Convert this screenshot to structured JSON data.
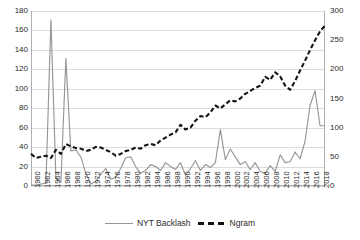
{
  "chart_data": {
    "type": "line",
    "title": "",
    "xlabel": "",
    "ylabel": "",
    "grid": true,
    "legend_position": "bottom",
    "x": [
      1960,
      1961,
      1962,
      1963,
      1964,
      1965,
      1966,
      1967,
      1968,
      1969,
      1970,
      1971,
      1972,
      1973,
      1974,
      1975,
      1976,
      1977,
      1978,
      1979,
      1980,
      1981,
      1982,
      1983,
      1984,
      1985,
      1986,
      1987,
      1988,
      1989,
      1990,
      1991,
      1992,
      1993,
      1994,
      1995,
      1996,
      1997,
      1998,
      1999,
      2000,
      2001,
      2002,
      2003,
      2004,
      2005,
      2006,
      2007,
      2008,
      2009,
      2010,
      2011,
      2012,
      2013,
      2014,
      2015,
      2016,
      2017,
      2018,
      2019
    ],
    "xtick_labels": [
      "1960",
      "1962",
      "1964",
      "1966",
      "1968",
      "1970",
      "1972",
      "1974",
      "1976",
      "1978",
      "1980",
      "1982",
      "1984",
      "1986",
      "1988",
      "1990",
      "1992",
      "1994",
      "1996",
      "1998",
      "2000",
      "2002",
      "2004",
      "2006",
      "2008",
      "2010",
      "2012",
      "2014",
      "2016",
      "2018"
    ],
    "xtick_values": [
      1960,
      1962,
      1964,
      1966,
      1968,
      1970,
      1972,
      1974,
      1976,
      1978,
      1980,
      1982,
      1984,
      1986,
      1988,
      1990,
      1992,
      1994,
      1996,
      1998,
      2000,
      2002,
      2004,
      2006,
      2008,
      2010,
      2012,
      2014,
      2016,
      2018
    ],
    "left_axis": {
      "label": "",
      "ylim": [
        0,
        180
      ],
      "ticks": [
        0,
        20,
        40,
        60,
        80,
        100,
        120,
        140,
        160,
        180
      ],
      "tick_labels": [
        "0",
        "20",
        "40",
        "60",
        "80",
        "100",
        "120",
        "140",
        "160",
        "180"
      ]
    },
    "right_axis": {
      "label": "",
      "ylim": [
        0,
        300
      ],
      "ticks": [
        0,
        50,
        100,
        150,
        200,
        250,
        300
      ],
      "tick_labels": [
        "0",
        "50",
        "100",
        "150",
        "200",
        "250",
        "300"
      ]
    },
    "series": [
      {
        "name": "NYT Backlash",
        "axis": "left",
        "style": "solid",
        "color": "#969696",
        "values": [
          1,
          1,
          2,
          3,
          171,
          8,
          4,
          131,
          36,
          37,
          30,
          13,
          2,
          5,
          12,
          18,
          7,
          9,
          18,
          29,
          30,
          20,
          13,
          16,
          22,
          20,
          16,
          24,
          20,
          17,
          24,
          11,
          18,
          26,
          16,
          22,
          19,
          24,
          58,
          27,
          38,
          30,
          22,
          25,
          17,
          24,
          15,
          13,
          21,
          15,
          32,
          24,
          25,
          35,
          28,
          46,
          83,
          98,
          62,
          62
        ]
      },
      {
        "name": "Ngram",
        "axis": "right",
        "style": "dashed",
        "color": "#141414",
        "values": [
          55,
          48,
          50,
          52,
          48,
          62,
          55,
          72,
          68,
          65,
          64,
          60,
          62,
          67,
          66,
          62,
          58,
          52,
          55,
          60,
          62,
          66,
          64,
          70,
          72,
          70,
          78,
          83,
          88,
          92,
          105,
          97,
          100,
          112,
          120,
          118,
          126,
          138,
          133,
          140,
          147,
          145,
          150,
          158,
          163,
          168,
          172,
          187,
          182,
          195,
          188,
          172,
          165,
          180,
          198,
          215,
          233,
          250,
          265,
          275
        ]
      }
    ]
  },
  "legend": {
    "items": [
      {
        "label": "NYT Backlash",
        "style": "solid"
      },
      {
        "label": "Ngram",
        "style": "dashed"
      }
    ]
  },
  "colors": {
    "series_solid": "#969696",
    "series_dashed": "#141414",
    "gridline": "#dcdcdc",
    "axis": "#b0b0b0",
    "text": "#2b2b2b",
    "background": "#ffffff"
  }
}
